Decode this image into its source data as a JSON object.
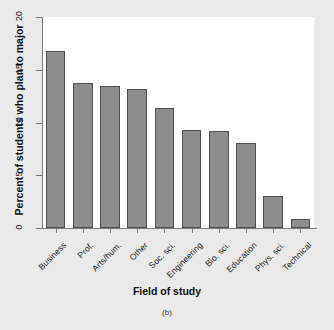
{
  "chart_data": {
    "type": "bar",
    "title": "",
    "xlabel": "Field of study",
    "ylabel": "Percent of students who plan to major",
    "categories": [
      "Business",
      "Prof.",
      "Arts/hum.",
      "Other",
      "Soc. sci.",
      "Engineering",
      "Bio. sci.",
      "Education",
      "Phys. sci.",
      "Technical"
    ],
    "values": [
      16.8,
      13.7,
      13.5,
      13.2,
      11.4,
      9.3,
      9.2,
      8.1,
      3.0,
      0.9
    ],
    "ylim": [
      0,
      20
    ],
    "yticks": [
      0,
      5,
      10,
      15,
      20
    ],
    "ytick_labels": [
      "0",
      "5",
      "10",
      "15",
      "20"
    ],
    "grid": false,
    "legend": "none",
    "bar_color": "#8d8d8d",
    "bar_edge_color": "#4f4f4f",
    "plot_background": "#ffffff",
    "page_background": "#e9e9e9"
  },
  "caption": "(b)"
}
